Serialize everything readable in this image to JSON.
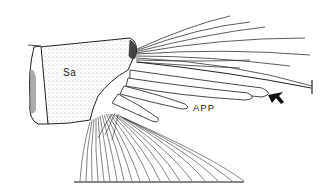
{
  "figure": {
    "type": "scientific-line-drawing",
    "labels": {
      "segment": "Sa",
      "appendage": "APP"
    },
    "annotations": {
      "arrow": "arrow pointing to appendage tip",
      "scale_tick": "terminal bar on long seta"
    },
    "colors": {
      "ink": "#222222",
      "background": "#ffffff",
      "stipple": "#555555"
    }
  }
}
